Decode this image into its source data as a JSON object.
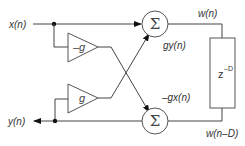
{
  "diagram": {
    "type": "block-diagram",
    "signals": {
      "input": "x(n)",
      "output": "y(n)",
      "delay_input": "w(n)",
      "delay_output": "w(n–D)",
      "top_feed": "gy(n)",
      "bottom_feed": "–gx(n)"
    },
    "blocks": {
      "gain_top": "–g",
      "gain_bottom": "g",
      "sum_top": "Σ",
      "sum_bottom": "Σ",
      "delay_base": "z",
      "delay_exp": "–D"
    }
  }
}
